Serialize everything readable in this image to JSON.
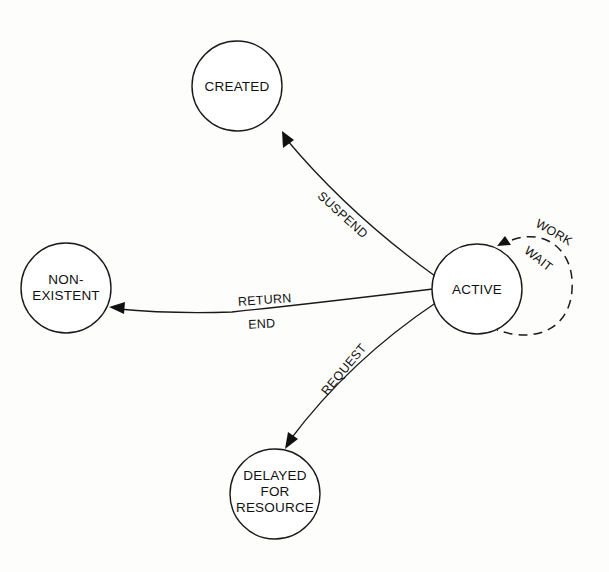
{
  "diagram": {
    "type": "state-transition",
    "states": [
      {
        "id": "created",
        "lines": [
          "CREATED"
        ]
      },
      {
        "id": "non-existent",
        "lines": [
          "NON-",
          "EXISTENT"
        ]
      },
      {
        "id": "active",
        "lines": [
          "ACTIVE"
        ]
      },
      {
        "id": "delayed",
        "lines": [
          "DELAYED",
          "FOR",
          "RESOURCE"
        ]
      }
    ],
    "transitions": [
      {
        "from": "active",
        "to": "created",
        "labels": [
          "SUSPEND"
        ]
      },
      {
        "from": "active",
        "to": "non-existent",
        "labels": [
          "RETURN",
          "END"
        ]
      },
      {
        "from": "active",
        "to": "delayed",
        "labels": [
          "REQUEST"
        ]
      },
      {
        "from": "active",
        "to": "active",
        "labels": [
          "WORK",
          "WAIT"
        ],
        "style": "dashed"
      }
    ]
  }
}
